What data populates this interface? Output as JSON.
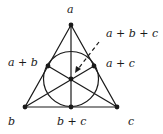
{
  "diagram": {
    "labels": {
      "top": "a",
      "left_mid": "a + b",
      "right_mid": "a + c",
      "center_callout": "a + b + c",
      "bottom_left": "b",
      "bottom_mid": "b + c",
      "bottom_right": "c"
    },
    "points": [
      {
        "name": "a",
        "x": 71,
        "y": 25
      },
      {
        "name": "b",
        "x": 25,
        "y": 107
      },
      {
        "name": "c",
        "x": 117,
        "y": 107
      },
      {
        "name": "a+b",
        "x": 48,
        "y": 66
      },
      {
        "name": "a+c",
        "x": 94,
        "y": 66
      },
      {
        "name": "b+c",
        "x": 71,
        "y": 107
      },
      {
        "name": "a+b+c",
        "x": 71,
        "y": 79
      }
    ],
    "colors": {
      "stroke": "#1a1a1a",
      "background": "#ffffff"
    }
  }
}
